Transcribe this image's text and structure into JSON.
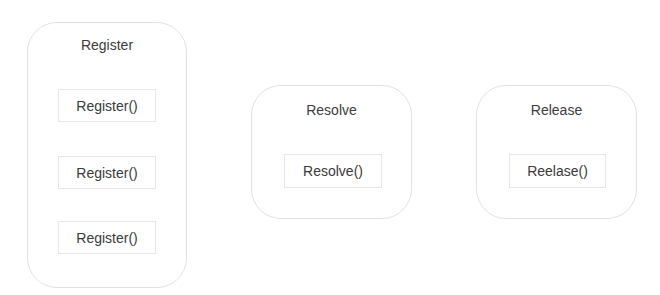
{
  "diagram": {
    "groups": [
      {
        "title": "Register",
        "methods": [
          "Register()",
          "Register()",
          "Register()"
        ]
      },
      {
        "title": "Resolve",
        "methods": [
          "Resolve()"
        ]
      },
      {
        "title": "Release",
        "methods": [
          "Reelase()"
        ]
      }
    ]
  },
  "colors": {
    "border": "#e2e2e2",
    "text": "#3a3a3a",
    "background": "#ffffff"
  }
}
